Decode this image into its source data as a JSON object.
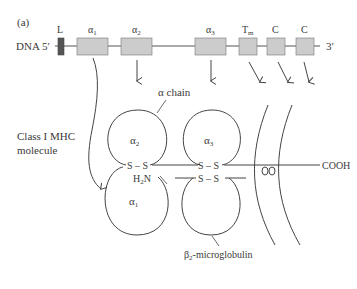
{
  "panel_label": "(a)",
  "dna": {
    "label": "DNA 5′",
    "end_label": "3′",
    "exons": [
      {
        "name": "L",
        "sub": "",
        "color": "#555555"
      },
      {
        "name": "α",
        "sub": "1",
        "color": "#cccccc"
      },
      {
        "name": "α",
        "sub": "2",
        "color": "#cccccc"
      },
      {
        "name": "α",
        "sub": "3",
        "color": "#cccccc"
      },
      {
        "name": "T",
        "sub": "m",
        "color": "#cccccc"
      },
      {
        "name": "C",
        "sub": "",
        "color": "#cccccc"
      },
      {
        "name": "C",
        "sub": "",
        "color": "#cccccc"
      }
    ]
  },
  "molecule": {
    "title_line1": "Class I MHC",
    "title_line2": "molecule",
    "alpha_chain_label": "α chain",
    "domains": [
      {
        "name": "α",
        "sub": "2"
      },
      {
        "name": "α",
        "sub": "3"
      },
      {
        "name": "α",
        "sub": "1"
      }
    ],
    "disulfide": "S – S",
    "n_terminus": "H",
    "n_terminus_sub": "2",
    "n_terminus_end": "N",
    "c_terminus": "COOH",
    "beta2m_label_prefix": "β",
    "beta2m_label_sub": "2",
    "beta2m_label_suffix": "-microglobulin"
  },
  "colors": {
    "line": "#444444",
    "exon_fill": "#cccccc",
    "leader_fill": "#555555"
  }
}
